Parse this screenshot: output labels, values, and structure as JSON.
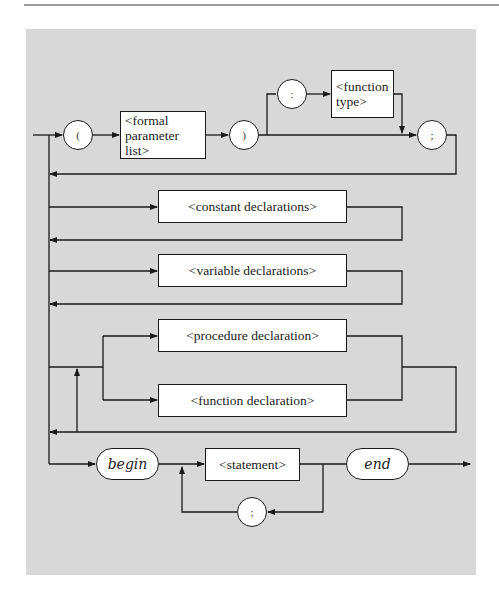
{
  "diagram": {
    "type": "syntax-diagram",
    "colors": {
      "panel": "#d8d8d8",
      "line": "#1a1a1a",
      "box_fill": "#ffffff"
    },
    "row1": {
      "open_paren": "(",
      "formal_parameter_list": [
        "<formal",
        "parameter list>"
      ],
      "close_paren": ")",
      "colon": ":",
      "function_type": [
        "<function",
        "type>"
      ],
      "semicolon": ";"
    },
    "constant_declarations": "<constant declarations>",
    "variable_declarations": "<variable declarations>",
    "procedure_declaration": "<procedure declaration>",
    "function_declaration": "<function declaration>",
    "bottom_row": {
      "begin": "begin",
      "statement": "<statement>",
      "end": "end",
      "separator": ";"
    }
  }
}
